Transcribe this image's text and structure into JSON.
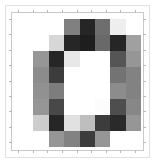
{
  "figure": {
    "title": "",
    "background_color": "#ffffff",
    "border_color": "#e2e2e2",
    "axes_spine_color": "#c9c9c9",
    "tick_color": "#b8b8b8"
  },
  "chart_data": {
    "type": "heatmap",
    "title": "",
    "subtitle": "",
    "xlabel": "",
    "ylabel": "",
    "colormap": "gray",
    "grid": false,
    "legend": "none",
    "xlim": [
      -0.5,
      7.5
    ],
    "ylim": [
      7.5,
      -0.5
    ],
    "xticklabels": [],
    "yticklabels": [],
    "rows": 8,
    "cols": 8,
    "vmin": 0,
    "vmax": 255,
    "values": [
      [
        255,
        255,
        255,
        128,
        38,
        110,
        238,
        255
      ],
      [
        255,
        255,
        215,
        38,
        30,
        105,
        38,
        160
      ],
      [
        255,
        150,
        38,
        232,
        255,
        255,
        85,
        150
      ],
      [
        255,
        140,
        60,
        255,
        255,
        255,
        115,
        130
      ],
      [
        255,
        145,
        125,
        255,
        255,
        255,
        140,
        130
      ],
      [
        255,
        150,
        72,
        255,
        255,
        252,
        78,
        135
      ],
      [
        255,
        205,
        38,
        225,
        190,
        60,
        42,
        150
      ],
      [
        255,
        255,
        150,
        130,
        60,
        150,
        255,
        255
      ]
    ],
    "hex_values": [
      [
        "#ffffff",
        "#ffffff",
        "#ffffff",
        "#808080",
        "#262626",
        "#6e6e6e",
        "#eeeeee",
        "#ffffff"
      ],
      [
        "#ffffff",
        "#ffffff",
        "#d7d7d7",
        "#262626",
        "#1e1e1e",
        "#696969",
        "#262626",
        "#a0a0a0"
      ],
      [
        "#ffffff",
        "#969696",
        "#262626",
        "#e8e8e8",
        "#ffffff",
        "#ffffff",
        "#555555",
        "#969696"
      ],
      [
        "#ffffff",
        "#8c8c8c",
        "#3c3c3c",
        "#ffffff",
        "#ffffff",
        "#ffffff",
        "#737373",
        "#828282"
      ],
      [
        "#ffffff",
        "#919191",
        "#7d7d7d",
        "#ffffff",
        "#ffffff",
        "#ffffff",
        "#8c8c8c",
        "#828282"
      ],
      [
        "#ffffff",
        "#969696",
        "#484848",
        "#ffffff",
        "#ffffff",
        "#fcfcfc",
        "#4e4e4e",
        "#878787"
      ],
      [
        "#ffffff",
        "#cdcdcd",
        "#262626",
        "#e1e1e1",
        "#bebebe",
        "#3c3c3c",
        "#2a2a2a",
        "#969696"
      ],
      [
        "#ffffff",
        "#ffffff",
        "#969696",
        "#828282",
        "#3c3c3c",
        "#969696",
        "#ffffff",
        "#ffffff"
      ]
    ]
  },
  "ticks": {
    "left_count": 8,
    "bottom_count": 8,
    "top_count": 8,
    "right_count": 8
  }
}
